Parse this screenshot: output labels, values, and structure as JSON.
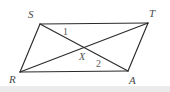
{
  "figure": {
    "type": "geometry-diagram",
    "shape_name": "parallelogram",
    "background_color": "#ffffff",
    "stroke_color": "#2b2b2b",
    "label_color": "#4a4a4a",
    "band_color": "#eceaea",
    "vertices": [
      {
        "label": "S",
        "x": 40,
        "y": 24,
        "label_x": 28,
        "label_y": 9
      },
      {
        "label": "T",
        "x": 148,
        "y": 23,
        "label_x": 149,
        "label_y": 8
      },
      {
        "label": "R",
        "x": 20,
        "y": 72,
        "label_x": 9,
        "label_y": 74
      },
      {
        "label": "A",
        "x": 128,
        "y": 71,
        "label_x": 129,
        "label_y": 75
      }
    ],
    "sides": [
      {
        "name": "ST",
        "from": "S",
        "to": "T"
      },
      {
        "name": "TA",
        "from": "T",
        "to": "A"
      },
      {
        "name": "AR",
        "from": "A",
        "to": "R"
      },
      {
        "name": "RS",
        "from": "R",
        "to": "S"
      }
    ],
    "diagonals": [
      {
        "name": "SA",
        "from": "S",
        "to": "A"
      },
      {
        "name": "RT",
        "from": "R",
        "to": "T"
      }
    ],
    "intersection": {
      "label": "X",
      "x": 84,
      "y": 47,
      "label_x": 79,
      "label_y": 52
    },
    "angle_labels": [
      {
        "label": "1",
        "x": 63,
        "y": 27
      },
      {
        "label": "2",
        "x": 96,
        "y": 59
      }
    ]
  }
}
